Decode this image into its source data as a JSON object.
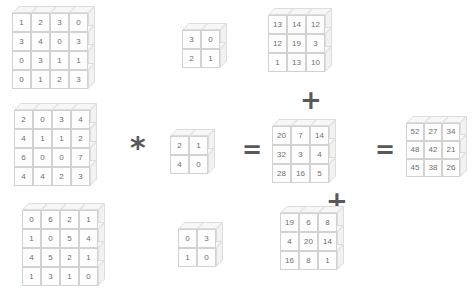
{
  "diagram": {
    "operators": {
      "convolve": "*",
      "equals": "=",
      "plus": "+"
    },
    "cell_text_color": "#6f6f6f",
    "cube_face_color": "#fdfdfd",
    "cube_edge_color": "#d2d2d2"
  },
  "chart_data": {
    "type": "table",
    "inputs": [
      {
        "name": "input-channel-1",
        "rows": 4,
        "cols": 4,
        "values": [
          [
            1,
            2,
            3,
            0
          ],
          [
            3,
            4,
            0,
            3
          ],
          [
            0,
            3,
            1,
            1
          ],
          [
            0,
            1,
            2,
            3
          ]
        ]
      },
      {
        "name": "input-channel-2",
        "rows": 4,
        "cols": 4,
        "values": [
          [
            2,
            0,
            3,
            4
          ],
          [
            4,
            1,
            1,
            2
          ],
          [
            6,
            0,
            0,
            7
          ],
          [
            4,
            4,
            2,
            3
          ]
        ]
      },
      {
        "name": "input-channel-3",
        "rows": 4,
        "cols": 4,
        "values": [
          [
            0,
            6,
            2,
            1
          ],
          [
            1,
            0,
            5,
            4
          ],
          [
            4,
            5,
            2,
            1
          ],
          [
            1,
            3,
            1,
            0
          ]
        ]
      }
    ],
    "kernels": [
      {
        "name": "kernel-1",
        "rows": 2,
        "cols": 2,
        "values": [
          [
            3,
            0
          ],
          [
            2,
            1
          ]
        ]
      },
      {
        "name": "kernel-2",
        "rows": 2,
        "cols": 2,
        "values": [
          [
            2,
            1
          ],
          [
            4,
            0
          ]
        ]
      },
      {
        "name": "kernel-3",
        "rows": 2,
        "cols": 2,
        "values": [
          [
            0,
            3
          ],
          [
            1,
            0
          ]
        ]
      }
    ],
    "feature_maps": [
      {
        "name": "feature-map-1",
        "rows": 3,
        "cols": 3,
        "values": [
          [
            13,
            14,
            12
          ],
          [
            12,
            19,
            3
          ],
          [
            1,
            13,
            10
          ]
        ]
      },
      {
        "name": "feature-map-2",
        "rows": 3,
        "cols": 3,
        "values": [
          [
            20,
            7,
            14
          ],
          [
            32,
            3,
            4
          ],
          [
            28,
            16,
            5
          ]
        ]
      },
      {
        "name": "feature-map-3",
        "rows": 3,
        "cols": 3,
        "values": [
          [
            19,
            6,
            8
          ],
          [
            4,
            20,
            14
          ],
          [
            16,
            8,
            1
          ]
        ]
      }
    ],
    "output": {
      "name": "output-feature-map",
      "rows": 3,
      "cols": 3,
      "values": [
        [
          52,
          27,
          34
        ],
        [
          48,
          42,
          21
        ],
        [
          45,
          38,
          26
        ]
      ]
    }
  }
}
